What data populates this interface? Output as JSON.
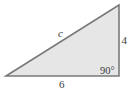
{
  "diagram": {
    "type": "right-triangle",
    "fill_color": "#e6e6e6",
    "stroke_color": "#7a7a7a",
    "vertices": {
      "left": [
        6,
        76
      ],
      "top_right": [
        119,
        5
      ],
      "bottom_right": [
        119,
        76
      ]
    },
    "labels": {
      "hypotenuse": "c",
      "vertical_side": "4",
      "horizontal_side": "6",
      "right_angle": "90°"
    }
  }
}
